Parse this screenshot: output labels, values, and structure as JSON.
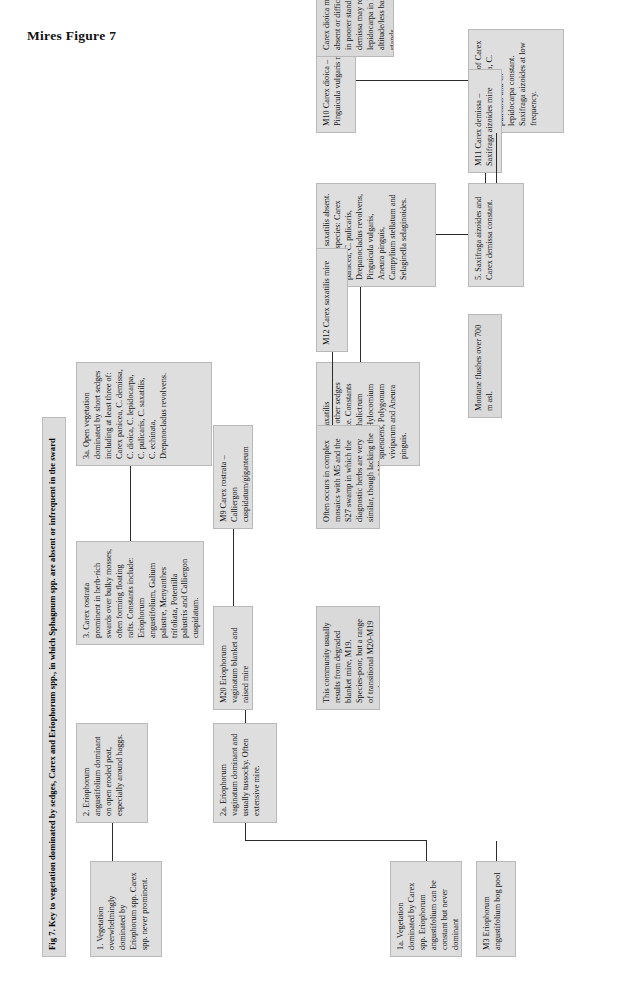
{
  "page": {
    "title": "Mires Figure 7"
  },
  "figure": {
    "caption": "Fig 7. Key to vegetation dominated by sedges, Carex and Eriophorum spp., in which Sphagnum spp. are absent or infrequent in the sward"
  },
  "nodes": {
    "n1": "1. Vegetation overwhelmingly dominated by Eriophorum spp. Carex spp. never prominent.",
    "n1a": "1a. Vegetation dominated by Carex spp. Eriophorum angustifolium can be constant but never dominant",
    "n2": "2. Eriophorum angustifolium dominant on open eroded peat, especially around haggs.",
    "n2a": "2a. Eriophorum vaginatum dominant and usually tussocky. Often extensive mire.",
    "n3": "3. Carex rostrata prominent in herb-rich swards over bulky mosses, often forming floating rafts. Constants include: Eriophorum angustifolium, Galium palustre, Menyanthes trifoliata, Potentilla palustris and Calliergon cuspidatum.",
    "n3a": "3a. Open vegetation dominated by short sedges including at least three of: Carex panicea, C. demissa, C. dioica, C. lepidocarpa, C. pulicaris, C. saxatilis, C. echinata, Drepanocladus revolvens.",
    "n4": "4. Carex saxatilis dominant, other sedges subordinate. Constants include: Thalictrum alpinum, Hylocomium splendens, Polygonum viviparum and Aneura pinguis.",
    "n4a": "4a. Carex saxatilis absent. Frequent species: Carex panicea, C. pulicaris, Drepanocladus revolvens, Pinguicula vulgaris, Aneura pinguis, Campylium stellatum and Selaginella selaginoides.",
    "n5": "5. Saxifraga aizoides and Carex demissa constant.",
    "n5a": "5a. Two or more of Carex dioica, C. panicea, C. pulicaris and C. lepidocarpa constant. Saxifraga aizoides at low frequency."
  },
  "communities": {
    "m3": "M3 Eriophorum angustifolium bog pool",
    "m20": "M20 Eriophorum vaginatum blanket and raised mire",
    "m9": "M9 Carex rostrata – Calliergon cuspidatum/giganteum mire",
    "m12": "M12 Carex saxatilis mire",
    "m11": "M11 Carex demissa – Saxifraga aizoides mire",
    "m10": "M10 Carex dioica – Pinguicula vulgaris mire"
  },
  "notes": {
    "m20_note": "This community usually results from degraded blanket mire, M19. Species-poor, but a range of transitional M20-M19 stands occurs.",
    "m9_note": "Often occurs in complex mosaics with M5 and the S27 swamp in which the diagnostic herbs are very similar, though lacking the moss carpet of M9.",
    "m12_note": "Montane flushes over 700 m asl.",
    "m10_note": "Carex dioica may be absent or difficult to find in poorer stands. C. demissa may replace C. lepidocarpa in higher altitude/less base-rich stands."
  }
}
